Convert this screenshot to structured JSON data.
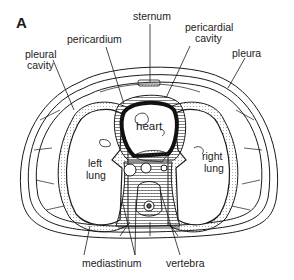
{
  "figure": {
    "panel_letter": "A"
  },
  "labels": {
    "sternum": "sternum",
    "pericardium": "pericardium",
    "pericardial_cavity_1": "pericardial",
    "pericardial_cavity_2": "cavity",
    "pleural_cavity_1": "pleural",
    "pleural_cavity_2": "cavity",
    "pleura": "pleura",
    "heart": "heart",
    "left_lung_1": "left",
    "left_lung_2": "lung",
    "right_lung_1": "right",
    "right_lung_2": "lung",
    "mediastinum": "mediastinum",
    "vertebra": "vertebra"
  },
  "colors": {
    "line": "#1a1a1a",
    "background": "#ffffff",
    "shading": "#b8b8b8",
    "stipple": "#d9d9d9"
  }
}
